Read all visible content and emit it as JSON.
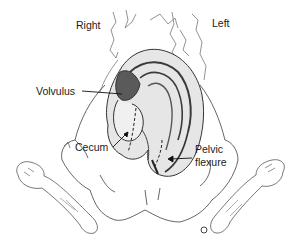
{
  "diagram": {
    "type": "anatomical illustration",
    "orientation_labels": {
      "right": "Right",
      "left": "Left"
    },
    "annotations": [
      {
        "id": "volvulus",
        "text": "Volvulus"
      },
      {
        "id": "cecum",
        "text": "Cecum"
      },
      {
        "id": "pelvic_flexure_line1",
        "text": "Pelvic"
      },
      {
        "id": "pelvic_flexure_line2",
        "text": "flexure"
      }
    ],
    "colors": {
      "background": "#ffffff",
      "outline": "#555555",
      "colon_shade_dark": "#3a3a3a",
      "colon_shade_mid": "#8a8a8a",
      "colon_fill": "#e6e6e6",
      "text": "#1a1a1a"
    }
  }
}
